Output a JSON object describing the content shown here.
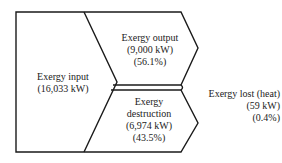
{
  "diagram": {
    "type": "exergy flow (Grassmann) diagram",
    "line_color": "#1a1a1a",
    "nodes": [
      {
        "id": "input",
        "title": "Exergy input",
        "value": "(16,033 kW)"
      },
      {
        "id": "output",
        "title": "Exergy output",
        "value": "(9,000 kW)",
        "percent": "(56.1%)"
      },
      {
        "id": "destruction",
        "title_line1": "Exergy",
        "title_line2": "destruction",
        "value": "(6,974 kW)",
        "percent": "(43.5%)"
      },
      {
        "id": "lost",
        "title": "Exergy lost (heat)",
        "value": "(59 kW)",
        "percent": "(0.4%)"
      }
    ]
  }
}
